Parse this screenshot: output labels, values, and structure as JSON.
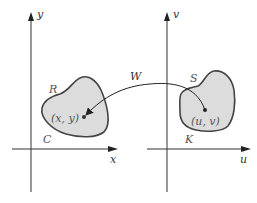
{
  "diagram": {
    "left_plane": {
      "x_axis_label": "x",
      "y_axis_label": "y",
      "region_label": "R",
      "boundary_label": "C",
      "point_label": "(x, y)"
    },
    "right_plane": {
      "x_axis_label": "u",
      "y_axis_label": "v",
      "region_label": "S",
      "boundary_label": "K",
      "point_label": "(u, v)"
    },
    "mapping_label": "W",
    "colors": {
      "region_fill": "#dcdcdc",
      "region_stroke": "#444444",
      "axis": "#333333",
      "arrow": "#222222"
    }
  }
}
